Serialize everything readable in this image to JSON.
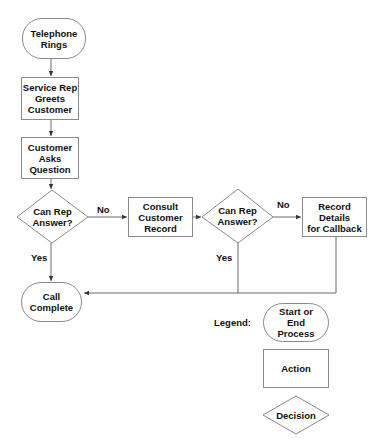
{
  "flowchart": {
    "nodes": {
      "telephone_rings": "Telephone\nRings",
      "service_rep_greets": "Service Rep\nGreets\nCustomer",
      "customer_asks": "Customer\nAsks\nQuestion",
      "decision_1": "Can Rep\nAnswer?",
      "consult_record": "Consult\nCustomer\nRecord",
      "decision_2": "Can Rep\nAnswer?",
      "record_details": "Record Details\nfor Callback",
      "call_complete": "Call Complete"
    },
    "edge_labels": {
      "d1_no": "No",
      "d1_yes": "Yes",
      "d2_no": "No",
      "d2_yes": "Yes"
    }
  },
  "legend": {
    "title": "Legend:",
    "start_end": "Start or\nEnd\nProcess",
    "action": "Action",
    "decision": "Decision"
  },
  "colors": {
    "shape_stroke": "#8a8a8a",
    "connector": "#555555",
    "text": "#111111"
  }
}
